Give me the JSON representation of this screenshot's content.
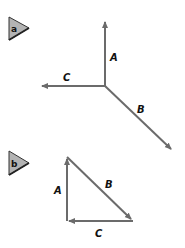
{
  "panels": [
    {
      "tag": "a",
      "vectors": [
        {
          "name": "A",
          "label": "A"
        },
        {
          "name": "B",
          "label": "B"
        },
        {
          "name": "C",
          "label": "C"
        }
      ]
    },
    {
      "tag": "b",
      "vectors": [
        {
          "name": "A",
          "label": "A"
        },
        {
          "name": "B",
          "label": "B"
        },
        {
          "name": "C",
          "label": "C"
        }
      ]
    }
  ],
  "colors": {
    "vector": "#6b6b6b",
    "tag_fill": "#b3b3b3",
    "tag_edge": "#333333"
  }
}
